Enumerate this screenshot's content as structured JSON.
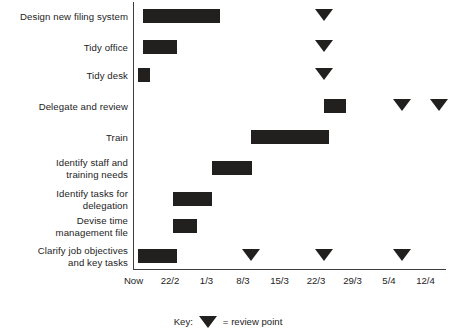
{
  "chart_data": {
    "type": "bar",
    "subtype": "gantt",
    "title": "",
    "xlabel": "",
    "ylabel": "",
    "grid": false,
    "legend_position": "bottom-center",
    "x_axis": {
      "tick_labels": [
        "Now",
        "22/2",
        "1/3",
        "8/3",
        "15/3",
        "22/3",
        "29/3",
        "5/4",
        "12/4"
      ],
      "tick_positions": [
        0,
        1,
        2,
        3,
        4,
        5,
        6,
        7,
        8
      ],
      "xlim": [
        0,
        8.55
      ]
    },
    "categories": [
      "Design new filing system",
      "Tidy office",
      "Tidy desk",
      "Delegate and review",
      "Train",
      "Identify staff and training needs",
      "Identify tasks for delegation",
      "Devise time management file",
      "Clarify job objectives and key tasks"
    ],
    "tasks": [
      {
        "label": "Design new filing system",
        "label_lines": [
          "Design new filing system"
        ],
        "start": 0.14,
        "end": 2.27,
        "reviews": [
          5.12
        ]
      },
      {
        "label": "Tidy office",
        "label_lines": [
          "Tidy office"
        ],
        "start": 0.14,
        "end": 1.07,
        "reviews": [
          5.12
        ]
      },
      {
        "label": "Tidy desk",
        "label_lines": [
          "Tidy desk"
        ],
        "start": 0.0,
        "end": 0.33,
        "reviews": [
          5.12
        ]
      },
      {
        "label": "Delegate and review",
        "label_lines": [
          "Delegate and review"
        ],
        "start": 5.12,
        "end": 5.72,
        "reviews": [
          7.26,
          8.25
        ]
      },
      {
        "label": "Train",
        "label_lines": [
          "Train"
        ],
        "start": 3.12,
        "end": 5.26,
        "reviews": []
      },
      {
        "label": "Identify staff and training needs",
        "label_lines": [
          "Identify staff and",
          "training needs"
        ],
        "start": 2.05,
        "end": 3.15,
        "reviews": []
      },
      {
        "label": "Identify tasks for delegation",
        "label_lines": [
          "Identify tasks for",
          "delegation"
        ],
        "start": 0.96,
        "end": 2.05,
        "reviews": []
      },
      {
        "label": "Devise time management file",
        "label_lines": [
          "Devise time",
          "management file"
        ],
        "start": 0.96,
        "end": 1.62,
        "reviews": []
      },
      {
        "label": "Clarify job objectives and key tasks",
        "label_lines": [
          "Clarify job objectives",
          "and key tasks"
        ],
        "start": 0.0,
        "end": 1.07,
        "reviews": [
          3.12,
          5.12,
          7.26
        ]
      }
    ]
  },
  "legend": {
    "key_label": "Key:",
    "marker_icon": "down-triangle-icon",
    "equals_text": "= review point"
  }
}
